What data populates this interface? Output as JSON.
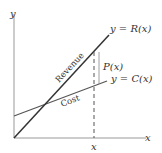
{
  "diagram": {
    "axes": {
      "x_label": "x",
      "y_label": "y",
      "x_tick_label": "x"
    },
    "lines": [
      {
        "name": "revenue",
        "label": "y = R(x)",
        "inline_label": "Revenue",
        "color": "#333333"
      },
      {
        "name": "cost",
        "label": "y = C(x)",
        "inline_label": "Cost",
        "color": "#555555"
      }
    ],
    "profit_label": "P(x)"
  }
}
